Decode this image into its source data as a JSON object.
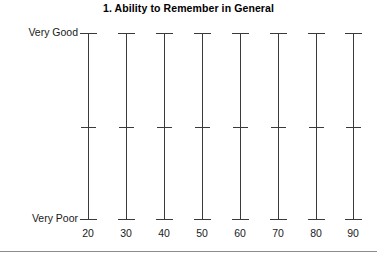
{
  "chart_data": {
    "type": "line",
    "title": "1. Ability to Remember in General",
    "xlabel": "",
    "ylabel": "",
    "x": [
      20,
      30,
      40,
      50,
      60,
      70,
      80,
      90
    ],
    "categories": [
      "20",
      "30",
      "40",
      "50",
      "60",
      "70",
      "80",
      "90"
    ],
    "y_axis": {
      "type": "ordinal",
      "top_label": "Very Good",
      "bottom_label": "Very Poor",
      "ticks": [
        "Very Poor",
        "Very Good"
      ],
      "grid": false
    },
    "legend": null,
    "series": [
      {
        "name": "Ability to Remember in General",
        "marker": "range-whisker",
        "points": [
          {
            "x": 20,
            "low": "Very Poor",
            "mid": "Mid",
            "high": "Very Good"
          },
          {
            "x": 30,
            "low": "Very Poor",
            "mid": "Mid",
            "high": "Very Good"
          },
          {
            "x": 40,
            "low": "Very Poor",
            "mid": "Mid",
            "high": "Very Good"
          },
          {
            "x": 50,
            "low": "Very Poor",
            "mid": "Mid",
            "high": "Very Good"
          },
          {
            "x": 60,
            "low": "Very Poor",
            "mid": "Mid",
            "high": "Very Good"
          },
          {
            "x": 70,
            "low": "Very Poor",
            "mid": "Mid",
            "high": "Very Good"
          },
          {
            "x": 80,
            "low": "Very Poor",
            "mid": "Mid",
            "high": "Very Good"
          },
          {
            "x": 90,
            "low": "Very Poor",
            "mid": "Mid",
            "high": "Very Good"
          }
        ]
      }
    ],
    "geometry": {
      "marker_x_px": [
        88,
        126,
        164,
        202,
        240,
        278,
        316,
        353
      ],
      "top_cap_y_px": 33,
      "mid_tick_y_px": 127,
      "bottom_cap_y_px": 219
    },
    "colors": {
      "line": "#3a3a3a",
      "text": "#1a1a1a",
      "title": "#000000",
      "rule": "#8c8c8c",
      "background": "#ffffff"
    }
  }
}
